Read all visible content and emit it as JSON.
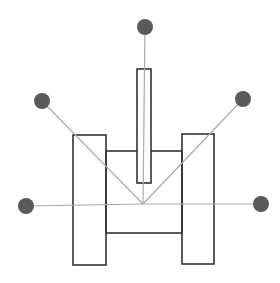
{
  "diagram": {
    "colors": {
      "background": "#ffffff",
      "outline": "#333333",
      "ray": "#aaaaaa",
      "sensor_dot": "#5a5a5a"
    },
    "center": {
      "x": 143,
      "y": 204
    },
    "body_parts": {
      "left_wheel": {
        "x": 73,
        "y": 135,
        "w": 33,
        "h": 130
      },
      "right_wheel": {
        "x": 182,
        "y": 134,
        "w": 32,
        "h": 130
      },
      "chassis": {
        "x": 106,
        "y": 151,
        "w": 76,
        "h": 82
      },
      "mast": {
        "x": 137,
        "y": 69,
        "w": 14,
        "h": 114
      }
    },
    "sensors": [
      {
        "name": "left",
        "x": 26,
        "y": 206,
        "r": 8
      },
      {
        "name": "upper-left",
        "x": 42,
        "y": 101,
        "r": 8
      },
      {
        "name": "top",
        "x": 145,
        "y": 27,
        "r": 8
      },
      {
        "name": "upper-right",
        "x": 243,
        "y": 99,
        "r": 8
      },
      {
        "name": "right",
        "x": 261,
        "y": 204,
        "r": 8
      }
    ]
  }
}
